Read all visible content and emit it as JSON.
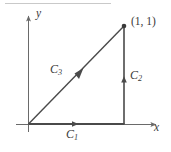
{
  "figure": {
    "axes": {
      "x_label": "x",
      "y_label": "y",
      "origin_label": ""
    },
    "vertex_label": "(1, 1)",
    "segments": [
      {
        "id": "C1",
        "name": "C",
        "subscript": "1",
        "orientation": "rightward",
        "from": [
          0,
          0
        ],
        "to": [
          1,
          0
        ],
        "description": "Horizontal segment along the x-axis from the origin to (1, 0)"
      },
      {
        "id": "C2",
        "name": "C",
        "subscript": "2",
        "orientation": "upward",
        "from": [
          1,
          0
        ],
        "to": [
          1,
          1
        ],
        "description": "Vertical segment from (1, 0) up to (1, 1)"
      },
      {
        "id": "C3",
        "name": "C",
        "subscript": "3",
        "orientation": "up-right",
        "from": [
          0,
          0
        ],
        "to": [
          1,
          1
        ],
        "description": "Diagonal segment from the origin to (1, 1)"
      }
    ],
    "colors": {
      "stroke": "#4a4a4a",
      "axis": "#6a6a6a",
      "label": "#3a3a3a",
      "rule": "#c9c9c9",
      "background": "#ffffff"
    }
  }
}
